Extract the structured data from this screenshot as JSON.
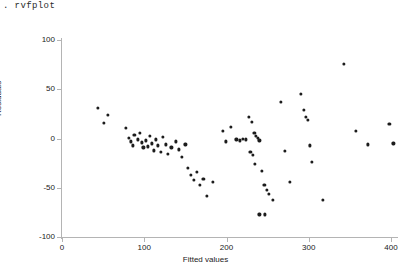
{
  "console": {
    "command": ". rvfplot"
  },
  "chart_data": {
    "type": "scatter",
    "title": "",
    "xlabel": "Fitted values",
    "ylabel": "Residuals",
    "xlim": [
      0,
      410
    ],
    "ylim": [
      -100,
      100
    ],
    "xticks": [
      0,
      100,
      200,
      300,
      400
    ],
    "yticks": [
      -100,
      -50,
      0,
      50,
      100
    ],
    "grid": false,
    "legend": null,
    "marker": {
      "shape": "circle",
      "color": "#1c1c1c",
      "size": 3
    },
    "points": [
      {
        "x": 44,
        "y": 31
      },
      {
        "x": 56,
        "y": 24
      },
      {
        "x": 51,
        "y": 16
      },
      {
        "x": 78,
        "y": 11
      },
      {
        "x": 81,
        "y": 1
      },
      {
        "x": 84,
        "y": -3
      },
      {
        "x": 86,
        "y": -7
      },
      {
        "x": 88,
        "y": 4
      },
      {
        "x": 92,
        "y": -1
      },
      {
        "x": 95,
        "y": 6
      },
      {
        "x": 97,
        "y": -4
      },
      {
        "x": 99,
        "y": -9
      },
      {
        "x": 102,
        "y": -2
      },
      {
        "x": 104,
        "y": -8
      },
      {
        "x": 107,
        "y": 3
      },
      {
        "x": 109,
        "y": -5
      },
      {
        "x": 112,
        "y": -12
      },
      {
        "x": 114,
        "y": -1
      },
      {
        "x": 117,
        "y": -7
      },
      {
        "x": 120,
        "y": -14
      },
      {
        "x": 123,
        "y": 2
      },
      {
        "x": 126,
        "y": -6
      },
      {
        "x": 129,
        "y": -16
      },
      {
        "x": 133,
        "y": -9
      },
      {
        "x": 138,
        "y": -3
      },
      {
        "x": 142,
        "y": -11
      },
      {
        "x": 146,
        "y": -19
      },
      {
        "x": 150,
        "y": -6
      },
      {
        "x": 153,
        "y": -30
      },
      {
        "x": 157,
        "y": -37
      },
      {
        "x": 160,
        "y": -42
      },
      {
        "x": 164,
        "y": -34
      },
      {
        "x": 168,
        "y": -47
      },
      {
        "x": 172,
        "y": -41
      },
      {
        "x": 176,
        "y": -58
      },
      {
        "x": 183,
        "y": -44
      },
      {
        "x": 196,
        "y": 8
      },
      {
        "x": 199,
        "y": -3
      },
      {
        "x": 205,
        "y": 12
      },
      {
        "x": 212,
        "y": -1
      },
      {
        "x": 216,
        "y": -2
      },
      {
        "x": 220,
        "y": 0
      },
      {
        "x": 224,
        "y": -1
      },
      {
        "x": 227,
        "y": 22
      },
      {
        "x": 231,
        "y": 17
      },
      {
        "x": 234,
        "y": 6
      },
      {
        "x": 236,
        "y": 3
      },
      {
        "x": 238,
        "y": 1
      },
      {
        "x": 240,
        "y": -2
      },
      {
        "x": 229,
        "y": -14
      },
      {
        "x": 232,
        "y": -17
      },
      {
        "x": 235,
        "y": -26
      },
      {
        "x": 243,
        "y": -33
      },
      {
        "x": 246,
        "y": -47
      },
      {
        "x": 249,
        "y": -52
      },
      {
        "x": 252,
        "y": -56
      },
      {
        "x": 256,
        "y": -62
      },
      {
        "x": 240,
        "y": -77
      },
      {
        "x": 247,
        "y": -77
      },
      {
        "x": 266,
        "y": 37
      },
      {
        "x": 271,
        "y": -13
      },
      {
        "x": 277,
        "y": -44
      },
      {
        "x": 290,
        "y": 45
      },
      {
        "x": 294,
        "y": 29
      },
      {
        "x": 297,
        "y": 22
      },
      {
        "x": 299,
        "y": 19
      },
      {
        "x": 301,
        "y": -7
      },
      {
        "x": 304,
        "y": -24
      },
      {
        "x": 317,
        "y": -62
      },
      {
        "x": 343,
        "y": 76
      },
      {
        "x": 357,
        "y": 8
      },
      {
        "x": 372,
        "y": -6
      },
      {
        "x": 398,
        "y": 15
      },
      {
        "x": 403,
        "y": -5
      }
    ]
  }
}
